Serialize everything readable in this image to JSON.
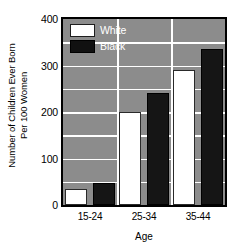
{
  "chart_data": {
    "type": "bar",
    "title": "",
    "categories": [
      "15-24",
      "25-34",
      "35-44"
    ],
    "series": [
      {
        "name": "White",
        "values": [
          35,
          200,
          290
        ],
        "color": "#ffffff"
      },
      {
        "name": "Black",
        "values": [
          48,
          240,
          335
        ],
        "color": "#111111"
      }
    ],
    "xlabel": "Age",
    "ylabel_line1": "Number of Children Ever Born",
    "ylabel_line2": "Per 100 Women",
    "ylim": [
      0,
      400
    ],
    "yticks": [
      0,
      100,
      200,
      300,
      400
    ],
    "ytick_labels": [
      "0",
      "100",
      "200",
      "300",
      "400"
    ],
    "gridlines": [
      50,
      100,
      150,
      200,
      250,
      300,
      350
    ],
    "grid": true,
    "legend_position": "top-left",
    "plot_background": "#8c8c8c",
    "gridline_color": "#ffffff",
    "axis_color": "#000000"
  },
  "legend": {
    "entries": [
      {
        "label": "White",
        "swatch": "white"
      },
      {
        "label": "Black",
        "swatch": "black"
      }
    ]
  }
}
